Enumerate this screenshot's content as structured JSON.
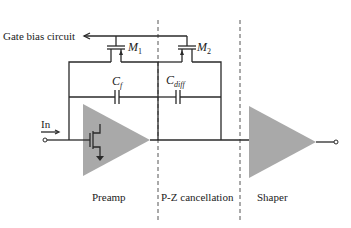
{
  "labels": {
    "gate_bias": "Gate bias circuit",
    "m1_main": "M",
    "m1_sub": "1",
    "m2_main": "M",
    "m2_sub": "2",
    "cf_main": "C",
    "cf_sub": "f",
    "cdiff_main": "C",
    "cdiff_sub": "diff",
    "input": "In"
  },
  "sections": [
    {
      "label": "Preamp"
    },
    {
      "label": "P-Z cancellation"
    },
    {
      "label": "Shaper"
    }
  ],
  "colors": {
    "amplifier_fill": "#a9a9a9",
    "wire": "#2a2a2a",
    "divider": "#555555"
  }
}
